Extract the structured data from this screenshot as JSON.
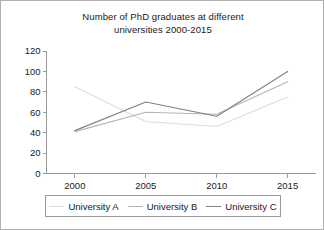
{
  "chart_data": {
    "type": "line",
    "title": "Number of PhD graduates at different universities 2000-2015",
    "title_lines": [
      "Number of PhD graduates at different",
      "universities 2000-2015"
    ],
    "xlabel": "",
    "ylabel": "",
    "categories": [
      "2000",
      "2005",
      "2010",
      "2015"
    ],
    "x": [
      2000,
      2005,
      2010,
      2015
    ],
    "xlim": [
      1998,
      2017
    ],
    "ylim": [
      0,
      120
    ],
    "yticks": [
      0,
      20,
      40,
      60,
      80,
      100,
      120
    ],
    "ytick_labels": [
      "0",
      "20",
      "40",
      "60",
      "80",
      "100",
      "120"
    ],
    "xtick_labels": [
      "2000",
      "2005",
      "2010",
      "2015"
    ],
    "grid": false,
    "legend_position": "bottom",
    "series": [
      {
        "name": "University A",
        "values": [
          85,
          51,
          46,
          75
        ],
        "color": "#dcdcdc"
      },
      {
        "name": "University B",
        "values": [
          41,
          60,
          58,
          90
        ],
        "color": "#b4b4b4"
      },
      {
        "name": "University C",
        "values": [
          42,
          70,
          56,
          100
        ],
        "color": "#808080"
      }
    ]
  },
  "legend": {
    "entries": [
      {
        "label": "University A",
        "color": "#dcdcdc"
      },
      {
        "label": "University B",
        "color": "#b4b4b4"
      },
      {
        "label": "University C",
        "color": "#808080"
      }
    ]
  },
  "axes": {
    "axis_color": "#9a9a9a",
    "text_color": "#1a1a1a"
  }
}
